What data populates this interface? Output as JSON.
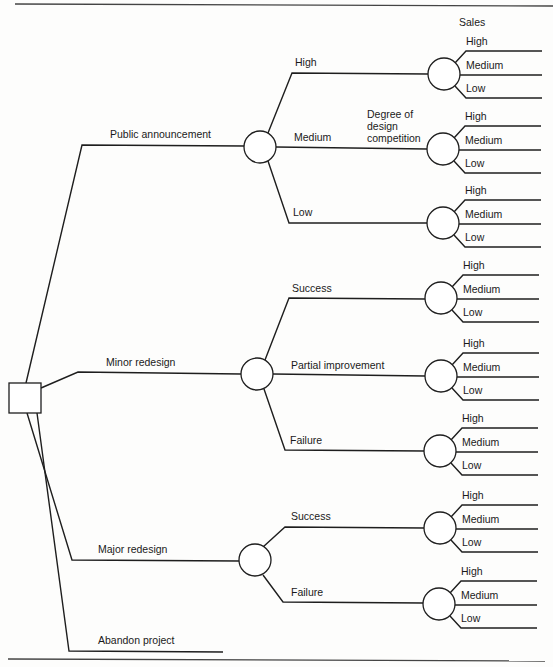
{
  "diagram": {
    "title_cut": "Figure: Design Competition Decision Tree",
    "column_header": "Sales",
    "chance_node_annotation": [
      "Degree of",
      "design",
      "competition"
    ],
    "decision_node": {
      "type": "square"
    },
    "alternatives": [
      {
        "label": "Public announcement",
        "outcomes": [
          {
            "label": "High",
            "sales": [
              "High",
              "Medium",
              "Low"
            ]
          },
          {
            "label": "Medium",
            "sales": [
              "High",
              "Medium",
              "Low"
            ]
          },
          {
            "label": "Low",
            "sales": [
              "High",
              "Medium",
              "Low"
            ]
          }
        ]
      },
      {
        "label": "Minor redesign",
        "outcomes": [
          {
            "label": "Success",
            "sales": [
              "High",
              "Medium",
              "Low"
            ]
          },
          {
            "label": "Partial improvement",
            "sales": [
              "High",
              "Medium",
              "Low"
            ]
          },
          {
            "label": "Failure",
            "sales": [
              "High",
              "Medium",
              "Low"
            ]
          }
        ]
      },
      {
        "label": "Major redesign",
        "outcomes": [
          {
            "label": "Success",
            "sales": [
              "High",
              "Medium",
              "Low"
            ]
          },
          {
            "label": "Failure",
            "sales": [
              "High",
              "Medium",
              "Low"
            ]
          }
        ]
      },
      {
        "label": "Abandon project",
        "outcomes": []
      }
    ]
  }
}
